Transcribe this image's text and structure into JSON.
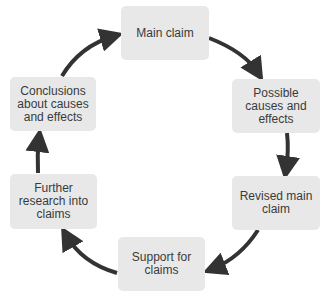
{
  "diagram": {
    "type": "cycle",
    "direction": "clockwise",
    "colors": {
      "box_fill": "#e8e8e8",
      "text": "#3a3a3a",
      "arrow": "#333333"
    },
    "nodes": [
      {
        "id": "main-claim",
        "label": "Main claim"
      },
      {
        "id": "possible-causes",
        "label": "Possible causes and effects"
      },
      {
        "id": "revised-main-claim",
        "label": "Revised main claim"
      },
      {
        "id": "support-for-claims",
        "label": "Support for claims"
      },
      {
        "id": "further-research",
        "label": "Further research into claims"
      },
      {
        "id": "conclusions",
        "label": "Conclusions about causes and effects"
      }
    ],
    "edges": [
      {
        "from": "main-claim",
        "to": "possible-causes"
      },
      {
        "from": "possible-causes",
        "to": "revised-main-claim"
      },
      {
        "from": "revised-main-claim",
        "to": "support-for-claims"
      },
      {
        "from": "support-for-claims",
        "to": "further-research"
      },
      {
        "from": "further-research",
        "to": "conclusions"
      },
      {
        "from": "conclusions",
        "to": "main-claim"
      }
    ]
  },
  "display": {
    "main_claim": [
      "Main claim"
    ],
    "possible_causes": [
      "Possible",
      "causes and",
      "effects"
    ],
    "revised_main_claim": [
      "Revised main",
      "claim"
    ],
    "support_for_claims": [
      "Support for",
      "claims"
    ],
    "further_research": [
      "Further",
      "research into",
      "claims"
    ],
    "conclusions": [
      "Conclusions",
      "about causes",
      "and effects"
    ]
  }
}
